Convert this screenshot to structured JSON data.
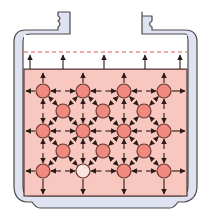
{
  "diagram": {
    "colors": {
      "background": "#ffffff",
      "wall_fill": "#dfe2f0",
      "wall_stroke": "#4a4a4a",
      "liquid": "#f8c8c0",
      "liquid_stroke": "#5a3a36",
      "node_fill": "#f08a7e",
      "node_light_fill": "#fbe4de",
      "node_stroke": "#6b3a35",
      "arrow": "#2a1a18",
      "dashed_line": "#e05a50"
    },
    "liquid_surface_y": 69,
    "dashed_line_y": 52,
    "surface_arrows_x": [
      30,
      63,
      104,
      145,
      180
    ],
    "grid_columns_x": [
      43,
      83,
      124,
      164
    ],
    "grid_rows_y": [
      91,
      131,
      171
    ],
    "mid_columns_x": [
      63,
      103,
      144
    ],
    "mid_rows_y": [
      111,
      151
    ],
    "light_node": {
      "col": 1,
      "row": 2
    },
    "node_radius": 7
  }
}
